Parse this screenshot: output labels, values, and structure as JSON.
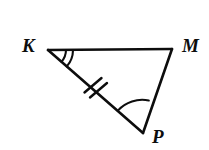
{
  "figure": {
    "kind": "geometry-diagram",
    "shape": "triangle",
    "name": "triangle-KMP",
    "background_color": "#ffffff",
    "stroke_color": "#0d0d0d",
    "stroke_width": 2.6,
    "width": 209,
    "height": 150
  },
  "vertices": [
    {
      "id": "K",
      "label": "K",
      "x": 48,
      "y": 50,
      "label_x": 22,
      "label_y": 36
    },
    {
      "id": "M",
      "label": "M",
      "x": 172,
      "y": 49,
      "label_x": 182,
      "label_y": 36
    },
    {
      "id": "P",
      "label": "P",
      "x": 143,
      "y": 133,
      "label_x": 152,
      "label_y": 127
    }
  ],
  "sides": [
    {
      "id": "KM",
      "from": "K",
      "to": "M",
      "tick_marks": 0
    },
    {
      "id": "MP",
      "from": "M",
      "to": "P",
      "tick_marks": 0
    },
    {
      "id": "KP",
      "from": "K",
      "to": "P",
      "tick_marks": 2,
      "midpoint_x": 95,
      "midpoint_y": 91
    }
  ],
  "angle_marks": [
    {
      "at": "K",
      "arcs": 2,
      "name": "angle-mark-K"
    },
    {
      "at": "P",
      "arcs": 1,
      "name": "angle-mark-P"
    }
  ],
  "labels": {
    "K": "K",
    "M": "M",
    "P": "P"
  }
}
